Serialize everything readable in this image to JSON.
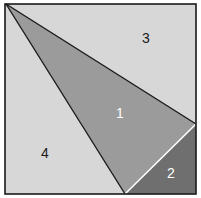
{
  "diagram": {
    "type": "square-partition",
    "square": {
      "x1": 5,
      "y1": 4,
      "x2": 196,
      "y2": 194
    },
    "colors": {
      "light": "#d7d7d7",
      "medium": "#9b9b9b",
      "dark": "#6f6f6f",
      "border": "#1a1a1a",
      "divider_white": "#ffffff"
    },
    "regions": [
      {
        "id": "1",
        "label": "1",
        "label_color": "#ffffff",
        "fill": "medium",
        "label_x": 120,
        "label_y": 118
      },
      {
        "id": "2",
        "label": "2",
        "label_color": "#ffffff",
        "fill": "dark",
        "label_x": 171,
        "label_y": 178
      },
      {
        "id": "3",
        "label": "3",
        "label_color": "#1a1a1a",
        "fill": "light",
        "label_x": 146,
        "label_y": 43
      },
      {
        "id": "4",
        "label": "4",
        "label_color": "#1a1a1a",
        "fill": "light",
        "label_x": 45,
        "label_y": 158
      }
    ]
  }
}
